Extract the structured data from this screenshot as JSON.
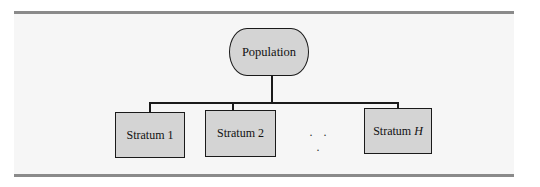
{
  "diagram": {
    "type": "tree",
    "root": {
      "label": "Population"
    },
    "children": [
      {
        "label": "Stratum 1"
      },
      {
        "label": "Stratum 2"
      },
      {
        "label": "Stratum",
        "italic_suffix": "H"
      }
    ],
    "ellipsis": ". . .",
    "colors": {
      "box_fill": "#d4d4d4",
      "box_border": "#1a1a1a",
      "panel_background": "#f6f6f6",
      "rule": "#8a8a8a"
    }
  }
}
